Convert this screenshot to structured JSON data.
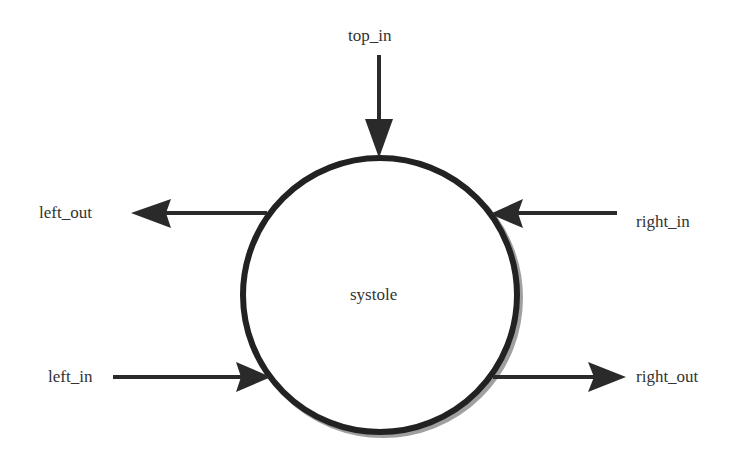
{
  "diagram": {
    "node": {
      "label": "systole",
      "shape": "circle",
      "cx": 380,
      "cy": 295,
      "r": 137,
      "stroke": "#222222",
      "shadow": "#9a9a9a"
    },
    "ports": [
      {
        "id": "top_in",
        "label": "top_in",
        "direction": "in",
        "side": "top"
      },
      {
        "id": "left_out",
        "label": "left_out",
        "direction": "out",
        "side": "left"
      },
      {
        "id": "right_in",
        "label": "right_in",
        "direction": "in",
        "side": "right"
      },
      {
        "id": "left_in",
        "label": "left_in",
        "direction": "in",
        "side": "left"
      },
      {
        "id": "right_out",
        "label": "right_out",
        "direction": "out",
        "side": "right"
      }
    ],
    "arrow_color": "#2a2a2a",
    "text_color": "#333333"
  }
}
